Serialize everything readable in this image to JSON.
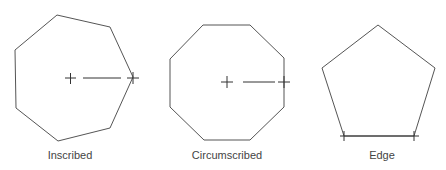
{
  "diagram": {
    "panels": [
      {
        "id": "inscribed",
        "label": "Inscribed",
        "sides": 7
      },
      {
        "id": "circumscribed",
        "label": "Circumscribed",
        "sides": 8
      },
      {
        "id": "edge",
        "label": "Edge",
        "sides": 5
      }
    ],
    "colors": {
      "stroke": "#555555",
      "text": "#444444",
      "background": "#ffffff"
    }
  }
}
